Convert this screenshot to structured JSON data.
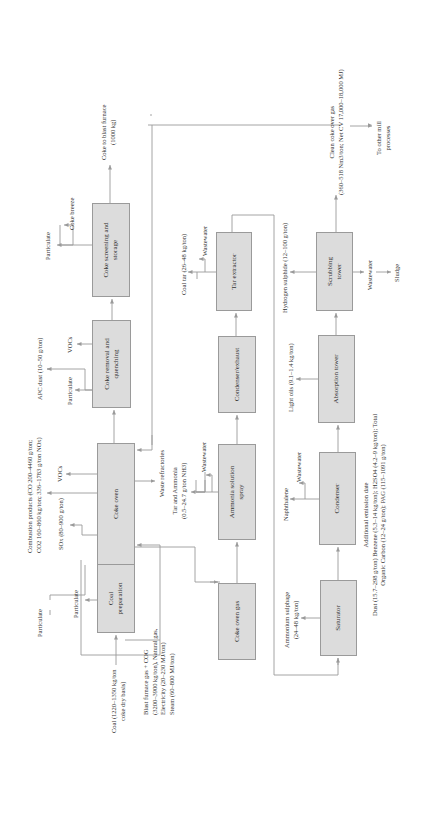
{
  "diagram": {
    "orientation": "rotated 90 degrees counter-clockwise",
    "box_fill": "#dcdcdc",
    "line_color": "#9a9a9a",
    "process_units": {
      "coal_preparation": "Coal preparation",
      "coke_oven": "Coke oven",
      "coke_removal": "Coke removal and quenching",
      "coke_screening": "Coke screening and storage",
      "coke_oven_gas": "Coke oven gas",
      "ammonia_spray": "Ammonia solution spray",
      "condenser_exhaust": "Condenser/exhaust",
      "tar_extractor": "Tar extractor",
      "saturator": "Saturator",
      "condenser": "Condenser",
      "absorption_tower": "Absorption tower",
      "scrubbing_tower": "Scrubbing tower"
    },
    "inputs": {
      "coal_line1": "Coal (1220–1350 kg/ton",
      "coal_line2": "coke dry basis)",
      "fuel_line1": "Blast furnace gas + COG",
      "fuel_line2": "(3200–3900 kg/ton), Natural gas,",
      "fuel_line3": "Electricity (20–230 MJ/ton)",
      "fuel_line4": "Steam (60–800 MJ/ton)"
    },
    "emissions": {
      "particulate_coal_prep": "Particulate",
      "particulate_coke_oven": "Particulate",
      "sox": "SOx (80–900 g/ton)",
      "combustion_line1": "Combustion products (CO 200–4460 g/ton;",
      "combustion_line2": "CO2 160–860 kg/ton; 336–1783 g/ton NOx)",
      "vocs_oven": "VOCs",
      "particulate_quench": "Particulate",
      "apc_dust": "APC dust (10–50 g/ton)",
      "vocs_quench": "VOCs",
      "particulate_screen": "Particulate",
      "coke_breeze": "Coke breeze",
      "waste_refractories": "Waste refractories",
      "tar_ammonia_line1": "Tar and Ammonia",
      "tar_ammonia_line2": "(0.5–24.7 g/ton NH3)",
      "wastewater_ammonia": "Wastewater",
      "coal_tar": "Coal tar (26–48 kg/ton)",
      "wastewater_tar": "Wastewater",
      "ammonium_sulphate_line1": "Ammonium sulphage",
      "ammonium_sulphate_line2": "(24–48 kg/ton)",
      "naphthalene": "Naphthalene",
      "wastewater_condenser": "Wastewater",
      "light_oils": "Light oils (9.1–1.4 kg/ton)",
      "hydrogen_sulphide": "Hydrogen sulphide (12–100 g/ton)",
      "wastewater_scrubbing": "Wastewater",
      "sludge": "Sludge"
    },
    "outputs": {
      "coke_line1": "Coke to blast furnace",
      "coke_line2": "(1000 kg)",
      "clean_gas_line1": "Clean coke over gas",
      "clean_gas_line2": "(360–518 Nm3/ton; Net CV 17,000–18,000 MJ)",
      "mill_line1": "To other mill",
      "mill_line2": "processes"
    },
    "additional": {
      "title": "Additional emission date",
      "line1": "Dust (15.7–298 g/ton) Benzene (5.3–14 kg/ton); H2SO4 (4.2–9 kg/ton); Total",
      "line2": "Organic Carbon (12–24 g/ton); PAG (115–1091 g/ton)"
    }
  }
}
